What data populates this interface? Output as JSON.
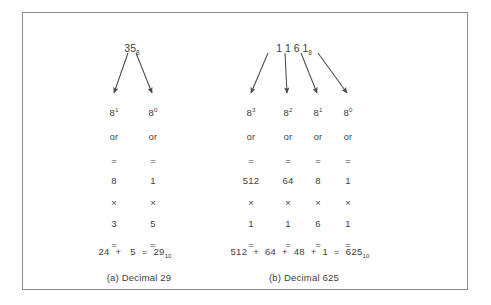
{
  "figure": {
    "border_color": "#8c8c8c",
    "text_color": "#3d3d3d",
    "background": "#ffffff"
  },
  "groups": [
    {
      "id": "group-a",
      "source_number": "35",
      "source_subscript": "8",
      "caption": "(a)  Decimal 29",
      "columns": [
        {
          "power_base": "8",
          "power_exponent": "1",
          "or_label": "or",
          "equals_top": "=",
          "place_value": "8",
          "times": "×",
          "digit": "3",
          "equals_bottom": "="
        },
        {
          "power_base": "8",
          "power_exponent": "0",
          "or_label": "or",
          "equals_top": "=",
          "place_value": "1",
          "times": "×",
          "digit": "5",
          "equals_bottom": "="
        }
      ],
      "summary": {
        "terms": [
          "24",
          "5"
        ],
        "plus": "+",
        "equals": "=",
        "result": "29",
        "result_subscript": "10"
      }
    },
    {
      "id": "group-b",
      "source_number": "1 1 6 1",
      "source_subscript": "8",
      "source_digits": [
        "1",
        "1",
        "6",
        "1"
      ],
      "caption": "(b)  Decimal 625",
      "columns": [
        {
          "power_base": "8",
          "power_exponent": "3",
          "or_label": "or",
          "equals_top": "=",
          "place_value": "512",
          "times": "×",
          "digit": "1",
          "equals_bottom": "="
        },
        {
          "power_base": "8",
          "power_exponent": "2",
          "or_label": "or",
          "equals_top": "=",
          "place_value": "64",
          "times": "×",
          "digit": "1",
          "equals_bottom": "="
        },
        {
          "power_base": "8",
          "power_exponent": "1",
          "or_label": "or",
          "equals_top": "=",
          "place_value": "8",
          "times": "×",
          "digit": "6",
          "equals_bottom": "="
        },
        {
          "power_base": "8",
          "power_exponent": "0",
          "or_label": "or",
          "equals_top": "=",
          "place_value": "1",
          "times": "×",
          "digit": "1",
          "equals_bottom": "="
        }
      ],
      "summary": {
        "terms": [
          "512",
          "64",
          "48",
          "1"
        ],
        "plus": "+",
        "equals": "=",
        "result": "625",
        "result_subscript": "10"
      }
    }
  ]
}
